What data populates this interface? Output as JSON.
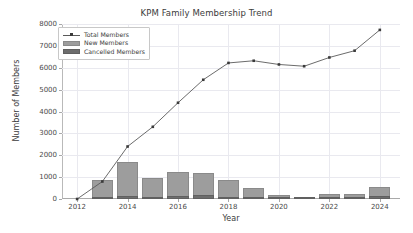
{
  "chart_data": {
    "type": "bar",
    "title": "KPM Family Membership Trend",
    "xlabel": "Year",
    "ylabel": "Number of Members",
    "categories": [
      2012,
      2013,
      2014,
      2015,
      2016,
      2017,
      2018,
      2019,
      2020,
      2021,
      2022,
      2023,
      2024
    ],
    "xtick_labels": [
      "2012",
      "2014",
      "2016",
      "2018",
      "2020",
      "2022",
      "2024"
    ],
    "xtick_values": [
      2012,
      2014,
      2016,
      2018,
      2020,
      2022,
      2024
    ],
    "ytick_labels": [
      "0",
      "1000",
      "2000",
      "3000",
      "4000",
      "5000",
      "6000",
      "7000",
      "8000"
    ],
    "ytick_values": [
      0,
      1000,
      2000,
      3000,
      4000,
      5000,
      6000,
      7000,
      8000
    ],
    "ylim": [
      0,
      8000
    ],
    "xlim": [
      2011.4,
      2024.8
    ],
    "grid": true,
    "legend_position": "upper left",
    "series": [
      {
        "name": "Total Members",
        "type": "line",
        "marker": "square",
        "color": "#5a5a5a",
        "values": [
          0,
          800,
          2400,
          3300,
          4400,
          5450,
          6220,
          6320,
          6150,
          6070,
          6470,
          6780,
          7730
        ]
      },
      {
        "name": "New Members",
        "type": "bar",
        "color": "#9d9d9d",
        "values": [
          0,
          870,
          1700,
          970,
          1240,
          1200,
          890,
          490,
          170,
          70,
          240,
          230,
          560
        ]
      },
      {
        "name": "Cancelled Members",
        "type": "bar",
        "color": "#6d6d6d",
        "values": [
          0,
          90,
          120,
          110,
          150,
          180,
          110,
          70,
          60,
          40,
          70,
          70,
          130
        ]
      }
    ]
  },
  "legend": {
    "entries": [
      {
        "label": "Total Members",
        "swatch": "line-marker-swatch"
      },
      {
        "label": "New Members",
        "swatch": "bar-swatch-light"
      },
      {
        "label": "Cancelled Members",
        "swatch": "bar-swatch-dark"
      }
    ]
  },
  "colors": {
    "line": "#5a5a5a",
    "bar_new": "#9d9d9d",
    "bar_cancelled": "#6d6d6d",
    "grid": "#e9e9ef",
    "axis": "#a9a9a9",
    "text": "#3b3b3b",
    "background": "#ffffff"
  }
}
